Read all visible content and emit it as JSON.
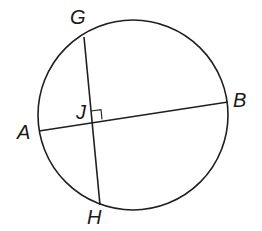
{
  "figure": {
    "type": "circle-with-perpendicular-chords",
    "colors": {
      "background": "#ffffff",
      "stroke": "#1f1f1f",
      "label": "#1a1a1a"
    },
    "circle": {
      "cx": 133,
      "cy": 115,
      "r": 95
    },
    "points": {
      "G": {
        "label": "G",
        "x": 84,
        "y": 37
      },
      "H": {
        "label": "H",
        "x": 100,
        "y": 205
      },
      "A": {
        "label": "A",
        "x": 39,
        "y": 131
      },
      "B": {
        "label": "B",
        "x": 228,
        "y": 102
      },
      "J": {
        "label": "J",
        "x": 92,
        "y": 121
      }
    },
    "chords": [
      {
        "name": "GH",
        "from": "G",
        "to": "H"
      },
      {
        "name": "AB",
        "from": "A",
        "to": "B"
      }
    ],
    "right_angle_marker": {
      "at": "J",
      "size": 10
    }
  },
  "labels": {
    "G": "G",
    "B": "B",
    "A": "A",
    "H": "H",
    "J": "J"
  }
}
